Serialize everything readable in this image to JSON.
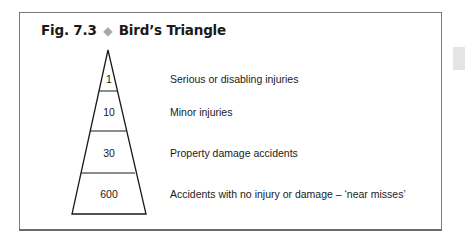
{
  "figure": {
    "number": "Fig. 7.3",
    "separator_icon": "diamond-icon",
    "title": "Bird’s Triangle"
  },
  "triangle": {
    "levels": [
      {
        "value": "1",
        "label": "Serious or disabling injuries"
      },
      {
        "value": "10",
        "label": "Minor injuries"
      },
      {
        "value": "30",
        "label": "Property damage accidents"
      },
      {
        "value": "600",
        "label": "Accidents with no injury or damage – ‘near misses’"
      }
    ]
  },
  "colors": {
    "border": "#7a7a7a",
    "diamond": "#a9a9a9",
    "text": "#1a1a1a",
    "side_tab": "#e4e4e4"
  }
}
